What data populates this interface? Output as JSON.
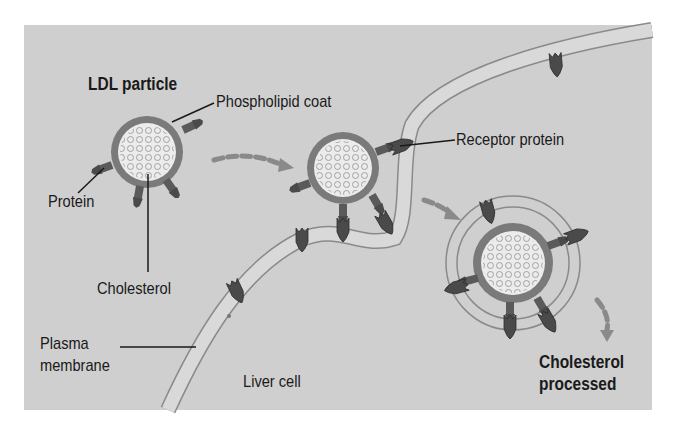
{
  "diagram": {
    "background_color": "#cfcfcf",
    "colors": {
      "coat": "#7a7a7a",
      "core": "#ececec",
      "protein": "#4a4a4a",
      "membrane_fill": "#d9d9d9",
      "membrane_line": "#8a8a8a",
      "arrow": "#8a8a8a",
      "text": "#1a1a1a"
    },
    "labels": {
      "ldl_particle": "LDL particle",
      "phospholipid_coat": "Phospholipid coat",
      "protein": "Protein",
      "cholesterol": "Cholesterol",
      "receptor_protein": "Receptor protein",
      "plasma_membrane_line1": "Plasma",
      "plasma_membrane_line2": "membrane",
      "liver_cell": "Liver cell",
      "cholesterol_processed_line1": "Cholesterol",
      "cholesterol_processed_line2": "processed"
    },
    "stages": [
      {
        "name": "LDL particle in bloodstream",
        "cx": 147,
        "cy": 152
      },
      {
        "name": "LDL bound to receptor proteins",
        "cx": 343,
        "cy": 168
      },
      {
        "name": "Endocytosed vesicle",
        "cx": 513,
        "cy": 263
      }
    ]
  }
}
